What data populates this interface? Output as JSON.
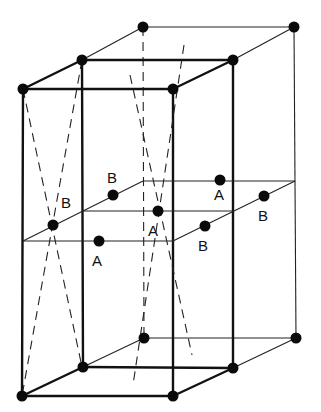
{
  "figure": {
    "colors": {
      "line": "#111111",
      "atom": "#0a0a0a",
      "background": "#ffffff"
    },
    "labels": [
      {
        "text": "B",
        "x": 61,
        "y": 208
      },
      {
        "text": "B",
        "x": 107,
        "y": 183
      },
      {
        "text": "A",
        "x": 92,
        "y": 266
      },
      {
        "text": "A",
        "x": 148,
        "y": 236
      },
      {
        "text": "A",
        "x": 214,
        "y": 200
      },
      {
        "text": "B",
        "x": 198,
        "y": 251
      },
      {
        "text": "B",
        "x": 258,
        "y": 221
      }
    ],
    "atoms": [
      {
        "name": "corner-front-top-left",
        "x": 23,
        "y": 89
      },
      {
        "name": "corner-front-top-right",
        "x": 173,
        "y": 89
      },
      {
        "name": "corner-mid-top-left",
        "x": 82,
        "y": 60
      },
      {
        "name": "corner-mid-top-right",
        "x": 233,
        "y": 60
      },
      {
        "name": "corner-back-top-left",
        "x": 143,
        "y": 27
      },
      {
        "name": "corner-back-top-right",
        "x": 294,
        "y": 27
      },
      {
        "name": "corner-front-bottom-left",
        "x": 22,
        "y": 396
      },
      {
        "name": "corner-front-bottom-right",
        "x": 173,
        "y": 396
      },
      {
        "name": "corner-mid-bottom-left",
        "x": 83,
        "y": 367
      },
      {
        "name": "corner-mid-bottom-right",
        "x": 233,
        "y": 368
      },
      {
        "name": "corner-back-bottom-left",
        "x": 144,
        "y": 338
      },
      {
        "name": "corner-back-bottom-right",
        "x": 296,
        "y": 338
      },
      {
        "name": "site-B-left",
        "x": 53,
        "y": 225
      },
      {
        "name": "site-B-upper",
        "x": 113,
        "y": 195
      },
      {
        "name": "site-A-front",
        "x": 99,
        "y": 241
      },
      {
        "name": "site-A-center",
        "x": 158,
        "y": 211
      },
      {
        "name": "site-A-back",
        "x": 220,
        "y": 180
      },
      {
        "name": "site-B-right-lower",
        "x": 205,
        "y": 226
      },
      {
        "name": "site-B-right-upper",
        "x": 264,
        "y": 196
      }
    ]
  }
}
